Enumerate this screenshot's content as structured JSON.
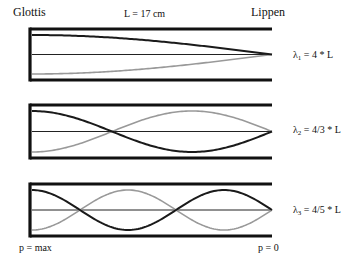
{
  "title_left": "Glottis",
  "title_center": "L = 17 cm",
  "title_right": "Lippen",
  "footer_left": "p = max",
  "footer_right": "p = 0",
  "colors": {
    "wall": "#111111",
    "axis": "#222222",
    "pressure_curve": "#1a1a1a",
    "velocity_curve": "#999999",
    "background": "#ffffff"
  },
  "tube": {
    "x_start": 30,
    "x_end": 272,
    "length_label": "L = 17 cm"
  },
  "modes": [
    {
      "index": 1,
      "lambda_symbol": "λ",
      "subscript": "1",
      "formula": " = 4 * L",
      "quarter_wavelengths": 1,
      "top": 29,
      "bottom": 80
    },
    {
      "index": 2,
      "lambda_symbol": "λ",
      "subscript": "2",
      "formula": " = 4/3 * L",
      "quarter_wavelengths": 3,
      "top": 105,
      "bottom": 158
    },
    {
      "index": 3,
      "lambda_symbol": "λ",
      "subscript": "3",
      "formula": " = 4/5 * L",
      "quarter_wavelengths": 5,
      "top": 184,
      "bottom": 236
    }
  ]
}
